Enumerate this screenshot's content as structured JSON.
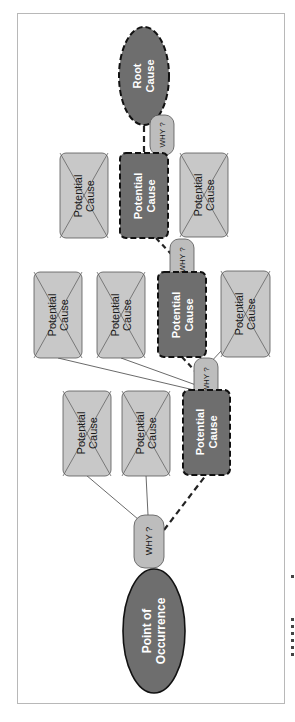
{
  "diagram": {
    "orientation": "rotated 90 degrees (text reads bottom-to-top)",
    "colors": {
      "dark_node_fill": "#6e6e6e",
      "light_node_fill": "#c8c8c8",
      "why_fill": "#bdbdbd",
      "stroke": "#222222",
      "light_text": "#ffffff",
      "dark_text": "#1a1a1a",
      "frame": "#b8b8b8"
    },
    "start_node": {
      "label_line1": "Point of",
      "label_line2": "Occurrence",
      "shape": "ellipse"
    },
    "end_node": {
      "label_line1": "Root",
      "label_line2": "Cause",
      "shape": "dashed-ellipse"
    },
    "why_label": "WHY ?",
    "why_nodes": [
      {
        "id": "why-1",
        "label": "WHY ?"
      },
      {
        "id": "why-2",
        "label": "WHY ?"
      },
      {
        "id": "why-3",
        "label": "WHY ?"
      },
      {
        "id": "why-4",
        "label": "WHY ?"
      }
    ],
    "levels": [
      {
        "level": 1,
        "selected": {
          "line1": "Potential",
          "line2": "Cause"
        },
        "rejected": [
          {
            "line1": "Potential",
            "line2": "Cause"
          },
          {
            "line1": "Potential",
            "line2": "Cause"
          }
        ]
      },
      {
        "level": 2,
        "selected": {
          "line1": "Potential",
          "line2": "Cause"
        },
        "rejected": [
          {
            "line1": "Potential",
            "line2": "Cause"
          },
          {
            "line1": "Potential",
            "line2": "Cause"
          },
          {
            "line1": "Potential",
            "line2": "Cause"
          }
        ]
      },
      {
        "level": 3,
        "selected": {
          "line1": "Potential",
          "line2": "Cause"
        },
        "rejected": [
          {
            "line1": "Potential",
            "line2": "Cause"
          },
          {
            "line1": "Potential",
            "line2": "Cause"
          }
        ]
      }
    ]
  }
}
